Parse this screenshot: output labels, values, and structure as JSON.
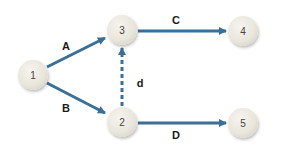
{
  "diagram": {
    "type": "activity-on-arrow network",
    "edge_color": "#3a6f96",
    "nodes": [
      {
        "id": "1",
        "label": "1",
        "x": 33,
        "y": 75
      },
      {
        "id": "2",
        "label": "2",
        "x": 122,
        "y": 122
      },
      {
        "id": "3",
        "label": "3",
        "x": 122,
        "y": 30
      },
      {
        "id": "4",
        "label": "4",
        "x": 243,
        "y": 31
      },
      {
        "id": "5",
        "label": "5",
        "x": 243,
        "y": 123
      }
    ],
    "edges": [
      {
        "from": "1",
        "to": "3",
        "label": "A",
        "style": "solid"
      },
      {
        "from": "1",
        "to": "2",
        "label": "B",
        "style": "solid"
      },
      {
        "from": "3",
        "to": "4",
        "label": "C",
        "style": "solid"
      },
      {
        "from": "2",
        "to": "5",
        "label": "D",
        "style": "solid"
      },
      {
        "from": "2",
        "to": "3",
        "label": "d",
        "style": "dashed"
      }
    ]
  }
}
